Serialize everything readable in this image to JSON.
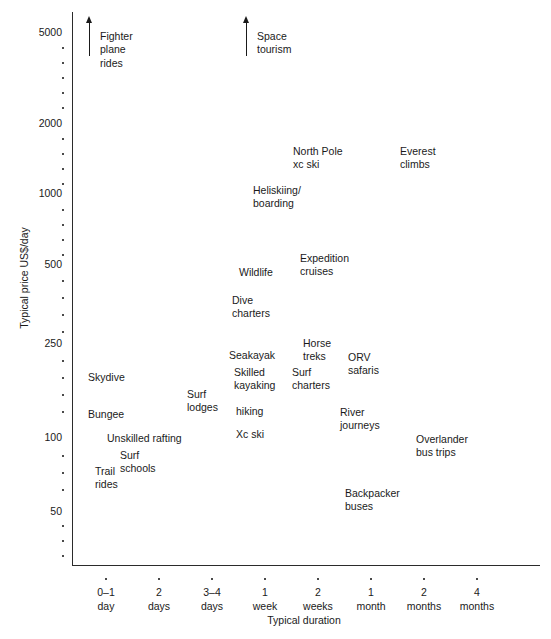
{
  "chart_data": {
    "type": "scatter",
    "title": "",
    "xlabel": "Typical duration",
    "ylabel": "Typical price US$/day",
    "yscale": "log",
    "ylim": [
      30,
      6000
    ],
    "grid": false,
    "legend": null,
    "y_ticks_labeled": [
      {
        "value": 5000,
        "label": "5000",
        "y": 32
      },
      {
        "value": 2000,
        "label": "2000",
        "y": 123
      },
      {
        "value": 1000,
        "label": "1000",
        "y": 193
      },
      {
        "value": 500,
        "label": "500",
        "y": 264
      },
      {
        "value": 250,
        "label": "250",
        "y": 343
      },
      {
        "value": 100,
        "label": "100",
        "y": 437
      },
      {
        "value": 50,
        "label": "50",
        "y": 511
      }
    ],
    "y_ticks_minor_y": [
      47,
      62,
      77,
      92,
      107,
      138,
      153,
      168,
      183,
      209,
      224,
      239,
      254,
      280,
      297,
      314,
      331,
      360,
      377,
      394,
      411,
      455,
      472,
      489,
      525,
      540,
      555
    ],
    "x_categories": [
      {
        "label": "0–1\nday",
        "line1": "0–1",
        "line2": "day",
        "x": 105
      },
      {
        "label": "2\ndays",
        "line1": "2",
        "line2": "days",
        "x": 158
      },
      {
        "label": "3–4\ndays",
        "line1": "3–4",
        "line2": "days",
        "x": 211
      },
      {
        "label": "1\nweek",
        "line1": "1",
        "line2": "week",
        "x": 264
      },
      {
        "label": "2\nweeks",
        "line1": "2",
        "line2": "weeks",
        "x": 317
      },
      {
        "label": "1\nmonth",
        "line1": "1",
        "line2": "month",
        "x": 370
      },
      {
        "label": "2\nmonths",
        "line1": "2",
        "line2": "months",
        "x": 423
      },
      {
        "label": "4\nmonths",
        "line1": "4",
        "line2": "months",
        "x": 476
      }
    ],
    "points": [
      {
        "name": "fighter-plane-rides",
        "label": "Fighter\nplane\nrides",
        "x": 100,
        "y": 30,
        "off_scale": true
      },
      {
        "name": "space-tourism",
        "label": "Space\ntourism",
        "x": 257,
        "y": 30,
        "off_scale": true
      },
      {
        "name": "north-pole-xc-ski",
        "label": "North Pole\nxc ski",
        "x": 293,
        "y": 145,
        "off_scale": false
      },
      {
        "name": "everest-climbs",
        "label": "Everest\nclimbs",
        "x": 400,
        "y": 145,
        "off_scale": false
      },
      {
        "name": "heliskiing-boarding",
        "label": "Heliskiing/\nboarding",
        "x": 253,
        "y": 184,
        "off_scale": false
      },
      {
        "name": "expedition-cruises",
        "label": "Expedition\ncruises",
        "x": 300,
        "y": 252,
        "off_scale": false
      },
      {
        "name": "wildlife",
        "label": "Wildlife",
        "x": 239,
        "y": 266,
        "off_scale": false
      },
      {
        "name": "dive-charters",
        "label": "Dive\ncharters",
        "x": 232,
        "y": 294,
        "off_scale": false
      },
      {
        "name": "horse-treks",
        "label": "Horse\ntreks",
        "x": 303,
        "y": 337,
        "off_scale": false
      },
      {
        "name": "orv-safaris",
        "label": "ORV\nsafaris",
        "x": 348,
        "y": 351,
        "off_scale": false
      },
      {
        "name": "seakayak",
        "label": "Seakayak",
        "x": 229,
        "y": 349,
        "off_scale": false
      },
      {
        "name": "skilled-kayaking",
        "label": "Skilled\nkayaking",
        "x": 234,
        "y": 366,
        "off_scale": false
      },
      {
        "name": "surf-charters",
        "label": "Surf\ncharters",
        "x": 292,
        "y": 366,
        "off_scale": false
      },
      {
        "name": "skydive",
        "label": "Skydive",
        "x": 88,
        "y": 371,
        "off_scale": false
      },
      {
        "name": "surf-lodges",
        "label": "Surf\nlodges",
        "x": 187,
        "y": 388,
        "off_scale": false
      },
      {
        "name": "hiking",
        "label": "hiking",
        "x": 236,
        "y": 405,
        "off_scale": false
      },
      {
        "name": "bungee",
        "label": "Bungee",
        "x": 88,
        "y": 408,
        "off_scale": false
      },
      {
        "name": "river-journeys",
        "label": "River\njourneys",
        "x": 340,
        "y": 406,
        "off_scale": false
      },
      {
        "name": "xc-ski",
        "label": "Xc ski",
        "x": 236,
        "y": 428,
        "off_scale": false
      },
      {
        "name": "unskilled-rafting",
        "label": "Unskilled rafting",
        "x": 107,
        "y": 432,
        "off_scale": false
      },
      {
        "name": "overlander-bus-trips",
        "label": "Overlander\nbus trips",
        "x": 416,
        "y": 433,
        "off_scale": false
      },
      {
        "name": "surf-schools",
        "label": "Surf\nschools",
        "x": 120,
        "y": 449,
        "off_scale": false
      },
      {
        "name": "trail-rides",
        "label": "Trail\nrides",
        "x": 95,
        "y": 465,
        "off_scale": false
      },
      {
        "name": "backpacker-buses",
        "label": "Backpacker\nbuses",
        "x": 345,
        "y": 487,
        "off_scale": false
      }
    ],
    "arrows": [
      {
        "name": "fighter-plane-rides-arrow",
        "x": 85,
        "y": 16,
        "height": 40
      },
      {
        "name": "space-tourism-arrow",
        "x": 242,
        "y": 16,
        "height": 40
      }
    ]
  }
}
